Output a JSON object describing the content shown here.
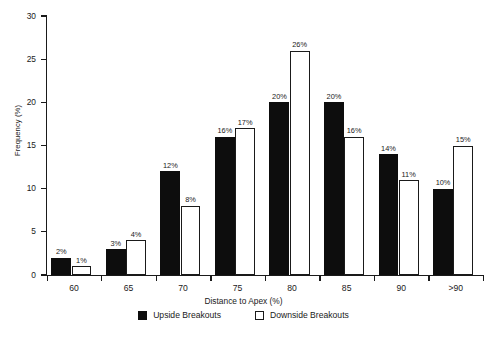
{
  "chart_data": {
    "type": "bar",
    "title": "",
    "subtitle": "",
    "categories": [
      "60",
      "65",
      "70",
      "75",
      "80",
      "85",
      "90",
      ">90"
    ],
    "series": [
      {
        "name": "Upside Breakouts",
        "color": "#0d0d0d",
        "style": "filled",
        "values": [
          2,
          3,
          12,
          16,
          20,
          20,
          14,
          10
        ],
        "value_labels": [
          "2%",
          "3%",
          "12%",
          "16%",
          "20%",
          "20%",
          "14%",
          "10%"
        ]
      },
      {
        "name": "Downside Breakouts",
        "color": "#ffffff",
        "style": "hollow",
        "values": [
          1,
          4,
          8,
          17,
          26,
          16,
          11,
          15
        ],
        "value_labels": [
          "1%",
          "4%",
          "8%",
          "17%",
          "26%",
          "16%",
          "11%",
          "15%"
        ]
      }
    ],
    "xlabel": "Distance to Apex (%)",
    "ylabel": "Frequency (%)",
    "ylim": [
      0,
      30
    ],
    "ytick_labels": [
      "0",
      "5",
      "10",
      "15",
      "20",
      "25",
      "30"
    ],
    "ytick_values": [
      0,
      5,
      10,
      15,
      20,
      25,
      30
    ],
    "grid": false,
    "legend_position": "bottom"
  },
  "legend": {
    "items": [
      {
        "label": "Upside Breakouts",
        "swatch": "filled-square-icon"
      },
      {
        "label": "Downside Breakouts",
        "swatch": "hollow-square-icon"
      }
    ]
  },
  "axes": {
    "x_title": "Distance to Apex (%)",
    "y_title": "Frequency (%)"
  }
}
